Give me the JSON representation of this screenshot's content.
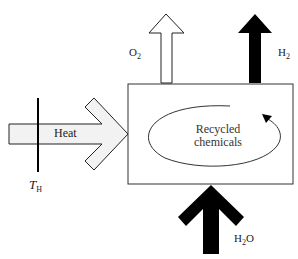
{
  "diagram": {
    "type": "process-schematic",
    "colors": {
      "stroke": "#222222",
      "heat_fill": "#f2f2f2",
      "o2_fill": "#ffffff",
      "dark_fill": "#000000",
      "box_fill": "#ffffff"
    },
    "heat_arrow": {
      "label": "Heat"
    },
    "temperature_marker": {
      "symbol": "T",
      "subscript": "H"
    },
    "reactor_box": {
      "cycle_label_line1": "Recycled",
      "cycle_label_line2": "chemicals",
      "cycle_direction": "clockwise"
    },
    "outputs": [
      {
        "id": "o2",
        "main": "O",
        "subscript": "2",
        "style": "hollow"
      },
      {
        "id": "h2",
        "main": "H",
        "subscript": "2",
        "style": "filled"
      }
    ],
    "inputs": [
      {
        "id": "h2o",
        "main": "H",
        "subscript": "2",
        "suffix": "O",
        "style": "filled"
      }
    ]
  }
}
